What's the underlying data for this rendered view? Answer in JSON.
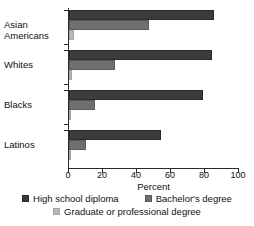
{
  "chart_data": {
    "type": "bar",
    "orientation": "horizontal",
    "title": "",
    "subtitle": "",
    "xlabel": "Percent",
    "ylabel": "",
    "xlim": [
      0,
      100
    ],
    "xticks": [
      0,
      20,
      40,
      60,
      80,
      100
    ],
    "xticklabels": [
      "0",
      "20",
      "40",
      "60",
      "80",
      "100"
    ],
    "grid": false,
    "legend_position": "bottom",
    "categories": [
      "Asian Americans",
      "Whites",
      "Blacks",
      "Latinos"
    ],
    "category_lines": [
      [
        "Asian",
        "Americans"
      ],
      [
        "Whites"
      ],
      [
        "Blacks"
      ],
      [
        "Latinos"
      ]
    ],
    "series": [
      {
        "name": "High school diploma",
        "color": "#3c3c3c",
        "values": [
          85,
          84,
          79,
          54
        ]
      },
      {
        "name": "Bachelor's degree",
        "color": "#6f6f6f",
        "values": [
          47,
          27,
          15,
          10
        ]
      },
      {
        "name": "Graduate or professional degree",
        "color": "#b8b8b8",
        "values": [
          3,
          2,
          1,
          1
        ]
      }
    ]
  },
  "axis": {
    "x_title": "Percent"
  },
  "legend": {
    "row1": [
      {
        "label": "High school diploma",
        "series_index": 0
      },
      {
        "label": "Bachelor's degree",
        "series_index": 1
      }
    ],
    "row2": [
      {
        "label": "Graduate or professional degree",
        "series_index": 2
      }
    ]
  }
}
